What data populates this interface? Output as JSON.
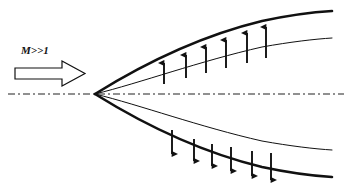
{
  "figure": {
    "type": "schematic-diagram",
    "width": 351,
    "height": 189,
    "background_color": "#ffffff",
    "ink_color": "#111111"
  },
  "labels": {
    "freestream_mach": "M>>1"
  },
  "inflow_arrow": {
    "name": "freestream-flow-arrow",
    "style": "hollow-block-arrow",
    "direction": "right",
    "fill": "#ffffff",
    "stroke": "#111111",
    "stroke_width": 1.2,
    "shaft": {
      "x": 15,
      "y": 68,
      "width": 47,
      "height": 11
    },
    "head": {
      "x": 62,
      "y": 61,
      "width": 23,
      "height": 25
    }
  },
  "centerline": {
    "name": "axis-centerline",
    "style": "dash-dot",
    "y": 94,
    "x_start": 8,
    "x_end": 344,
    "stroke": "#222222",
    "stroke_width": 1.1,
    "dash_pattern": "7 3 2 3"
  },
  "vertex": {
    "x": 95,
    "y": 94
  },
  "curves": [
    {
      "name": "upper-shock-wave",
      "role": "outer",
      "side": "upper",
      "stroke_width": 2.6,
      "stroke": "#111111",
      "path": "M 95 94 C 140 66, 200 36, 262 21 C 290 15, 315 12, 332 11"
    },
    {
      "name": "upper-body-surface",
      "role": "inner",
      "side": "upper",
      "stroke_width": 1.0,
      "stroke": "#111111",
      "path": "M 95 94 C 140 83, 200 61, 262 47 C 290 42, 315 39, 332 38"
    },
    {
      "name": "lower-body-surface",
      "role": "inner",
      "side": "lower",
      "stroke_width": 1.0,
      "stroke": "#111111",
      "path": "M 95 94 C 140 105, 200 127, 262 141 C 290 146, 315 149, 332 150"
    },
    {
      "name": "lower-shock-wave",
      "role": "outer",
      "side": "lower",
      "stroke_width": 2.6,
      "stroke": "#111111",
      "path": "M 95 94 C 140 122, 200 152, 262 167 C 290 173, 315 176, 332 177"
    }
  ],
  "upper_arrows": {
    "name": "upper-deflection-arrows",
    "direction": "up",
    "count": 6,
    "stroke": "#111111",
    "items": [
      {
        "x": 164,
        "y_tail": 84,
        "y_tip": 63
      },
      {
        "x": 186,
        "y_tail": 78,
        "y_tip": 55
      },
      {
        "x": 206,
        "y_tail": 73,
        "y_tip": 47
      },
      {
        "x": 226,
        "y_tail": 68,
        "y_tip": 40
      },
      {
        "x": 247,
        "y_tail": 63,
        "y_tip": 33
      },
      {
        "x": 266,
        "y_tail": 58,
        "y_tip": 27
      }
    ]
  },
  "lower_arrows": {
    "name": "lower-deflection-arrows",
    "direction": "down",
    "count": 6,
    "stroke": "#111111",
    "items": [
      {
        "x": 172,
        "y_tail": 130,
        "y_tip": 154
      },
      {
        "x": 194,
        "y_tail": 139,
        "y_tip": 161
      },
      {
        "x": 212,
        "y_tail": 144,
        "y_tip": 166
      },
      {
        "x": 231,
        "y_tail": 147,
        "y_tip": 171
      },
      {
        "x": 252,
        "y_tail": 151,
        "y_tip": 176
      },
      {
        "x": 271,
        "y_tail": 153,
        "y_tip": 180
      }
    ]
  }
}
